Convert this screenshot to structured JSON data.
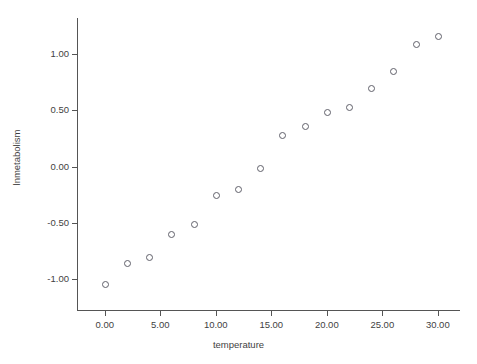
{
  "chart_data": {
    "type": "scatter",
    "title": "",
    "xlabel": "temperature",
    "ylabel": "lnmetabolism",
    "xlim": [
      -2.5,
      32.0
    ],
    "ylim": [
      -1.28,
      1.32
    ],
    "grid": false,
    "legend": null,
    "xticks": [
      0,
      5,
      10,
      15,
      20,
      25,
      30
    ],
    "xticklabels": [
      "0.00",
      "5.00",
      "10.00",
      "15.00",
      "20.00",
      "25.00",
      "30.00"
    ],
    "yticks": [
      -1.0,
      -0.5,
      0.0,
      0.5,
      1.0
    ],
    "yticklabels": [
      "-1.00",
      "-0.50",
      "0.00",
      "0.50",
      "1.00"
    ],
    "marker": "open-circle",
    "marker_color": "#60606a",
    "x": [
      0,
      2,
      4,
      6,
      8,
      10,
      12,
      14,
      16,
      18,
      20,
      22,
      24,
      26,
      28,
      30
    ],
    "y": [
      -1.04,
      -0.85,
      -0.8,
      -0.6,
      -0.51,
      -0.25,
      -0.2,
      -0.01,
      0.28,
      0.36,
      0.49,
      0.53,
      0.7,
      0.85,
      1.09,
      1.16
    ],
    "points": [
      {
        "x": 0,
        "y": -1.04
      },
      {
        "x": 2,
        "y": -0.85
      },
      {
        "x": 4,
        "y": -0.8
      },
      {
        "x": 6,
        "y": -0.6
      },
      {
        "x": 8,
        "y": -0.51
      },
      {
        "x": 10,
        "y": -0.25
      },
      {
        "x": 12,
        "y": -0.2
      },
      {
        "x": 14,
        "y": -0.01
      },
      {
        "x": 16,
        "y": 0.28
      },
      {
        "x": 18,
        "y": 0.36
      },
      {
        "x": 20,
        "y": 0.49
      },
      {
        "x": 22,
        "y": 0.53
      },
      {
        "x": 24,
        "y": 0.7
      },
      {
        "x": 26,
        "y": 0.85
      },
      {
        "x": 28,
        "y": 1.09
      },
      {
        "x": 30,
        "y": 1.16
      }
    ]
  },
  "figure": {
    "background_color": "#ffffff",
    "axis_color": "#555555",
    "text_color": "#3f3f3f"
  }
}
